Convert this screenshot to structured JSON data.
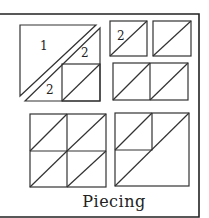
{
  "caption": "Piecing",
  "labels": {
    "large_triangle": "1",
    "upper_small_triangle": "2",
    "lower_small_triangle": "2",
    "small_block_label": "2"
  },
  "colors": {
    "line": "#333333",
    "frame": "#222222",
    "background": "#ffffff"
  },
  "groups": [
    {
      "name": "exploded-block",
      "pieces": [
        "large-triangle-1",
        "small-triangle-2-top",
        "small-triangle-2-bottom",
        "half-square-unit"
      ]
    },
    {
      "name": "half-square-units-single",
      "count": 2
    },
    {
      "name": "half-square-units-pair",
      "count": 2
    },
    {
      "name": "four-patch-of-half-square-units",
      "count": 4
    },
    {
      "name": "assembled-block",
      "count": 1
    }
  ]
}
